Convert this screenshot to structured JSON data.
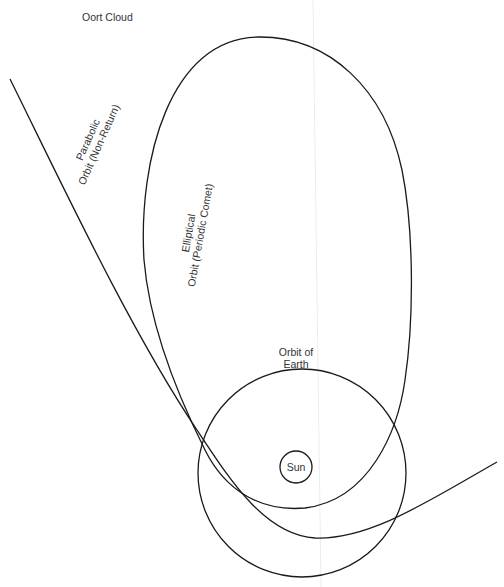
{
  "title_label": "Oort Cloud",
  "orbits": {
    "parabolic": {
      "line1": "Parabolic",
      "line2": "Orbit (Non-Return)"
    },
    "elliptical": {
      "line1": "Elliptical",
      "line2": "Orbit (Periodic Comet)"
    },
    "earth": {
      "line1": "Orbit of",
      "line2": "Earth"
    }
  },
  "sun_label": "Sun",
  "colors": {
    "stroke": "#1a1a1a",
    "background": "#ffffff",
    "text": "#333333"
  }
}
